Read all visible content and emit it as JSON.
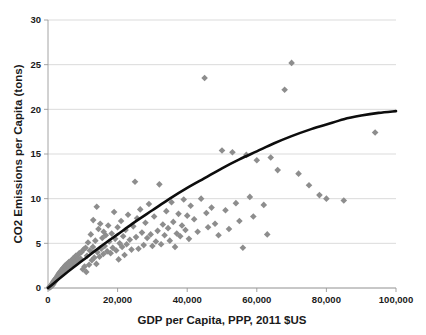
{
  "chart_data": {
    "type": "scatter",
    "title": "",
    "subtitle": "",
    "xlabel": "GDP per Capita, PPP, 2011 $US",
    "ylabel": "CO2 Emissions per Capita (tons)",
    "xlim": [
      0,
      100000
    ],
    "ylim": [
      0,
      30
    ],
    "xticks": [
      0,
      20000,
      40000,
      60000,
      80000,
      100000
    ],
    "xtick_labels": [
      "0",
      "20,000",
      "40,000",
      "60,000",
      "80,000",
      "100,000"
    ],
    "yticks": [
      0,
      5,
      10,
      15,
      20,
      25,
      30
    ],
    "ytick_labels": [
      "0",
      "5",
      "10",
      "15",
      "20",
      "25",
      "30"
    ],
    "grid": "horizontal",
    "legend": "none",
    "marker": {
      "shape": "diamond",
      "color": "#8d8d8d",
      "size": 3.3
    },
    "series": [
      {
        "name": "Countries",
        "type": "scatter",
        "points": [
          [
            300,
            0.05
          ],
          [
            450,
            0.08
          ],
          [
            500,
            0.12
          ],
          [
            620,
            0.1
          ],
          [
            700,
            0.2
          ],
          [
            780,
            0.15
          ],
          [
            850,
            0.25
          ],
          [
            900,
            0.3
          ],
          [
            980,
            0.2
          ],
          [
            1050,
            0.35
          ],
          [
            1100,
            0.4
          ],
          [
            1180,
            0.3
          ],
          [
            1250,
            0.5
          ],
          [
            1300,
            0.45
          ],
          [
            1400,
            0.6
          ],
          [
            1480,
            0.4
          ],
          [
            1550,
            0.7
          ],
          [
            1620,
            0.55
          ],
          [
            1700,
            0.8
          ],
          [
            1800,
            0.65
          ],
          [
            1900,
            0.9
          ],
          [
            2000,
            0.75
          ],
          [
            2100,
            1.0
          ],
          [
            2200,
            0.85
          ],
          [
            2300,
            1.1
          ],
          [
            2400,
            0.95
          ],
          [
            2500,
            1.2
          ],
          [
            2600,
            1.05
          ],
          [
            2700,
            1.35
          ],
          [
            2800,
            1.15
          ],
          [
            2900,
            1.45
          ],
          [
            3000,
            1.25
          ],
          [
            3100,
            1.6
          ],
          [
            3200,
            1.3
          ],
          [
            3300,
            1.7
          ],
          [
            3400,
            1.4
          ],
          [
            3500,
            1.8
          ],
          [
            3600,
            1.5
          ],
          [
            3700,
            1.9
          ],
          [
            3800,
            1.6
          ],
          [
            3900,
            2.0
          ],
          [
            4000,
            1.7
          ],
          [
            4100,
            2.1
          ],
          [
            4200,
            1.8
          ],
          [
            4300,
            2.2
          ],
          [
            4400,
            1.95
          ],
          [
            4500,
            2.3
          ],
          [
            4700,
            2.05
          ],
          [
            4900,
            2.5
          ],
          [
            5000,
            2.15
          ],
          [
            5200,
            2.6
          ],
          [
            5400,
            2.25
          ],
          [
            5600,
            2.7
          ],
          [
            5800,
            2.4
          ],
          [
            6000,
            2.9
          ],
          [
            6200,
            2.5
          ],
          [
            6400,
            3.0
          ],
          [
            6600,
            2.6
          ],
          [
            6800,
            3.1
          ],
          [
            7000,
            2.7
          ],
          [
            7200,
            3.3
          ],
          [
            7400,
            2.8
          ],
          [
            7600,
            3.4
          ],
          [
            7800,
            2.9
          ],
          [
            8000,
            3.6
          ],
          [
            8200,
            3.0
          ],
          [
            8500,
            3.7
          ],
          [
            8800,
            3.2
          ],
          [
            9000,
            3.9
          ],
          [
            9300,
            3.3
          ],
          [
            9600,
            4.0
          ],
          [
            10000,
            2.1
          ],
          [
            10200,
            4.3
          ],
          [
            10500,
            2.4
          ],
          [
            10800,
            4.5
          ],
          [
            11000,
            1.8
          ],
          [
            11200,
            3.6
          ],
          [
            11500,
            5.1
          ],
          [
            11800,
            2.6
          ],
          [
            12000,
            4.2
          ],
          [
            12300,
            6.0
          ],
          [
            12600,
            3.1
          ],
          [
            12900,
            4.6
          ],
          [
            13000,
            7.6
          ],
          [
            13300,
            3.4
          ],
          [
            13600,
            5.3
          ],
          [
            13900,
            2.7
          ],
          [
            14000,
            9.1
          ],
          [
            14200,
            4.0
          ],
          [
            14500,
            6.6
          ],
          [
            14800,
            3.5
          ],
          [
            15000,
            7.2
          ],
          [
            15300,
            4.4
          ],
          [
            15600,
            5.6
          ],
          [
            15900,
            3.8
          ],
          [
            16000,
            6.3
          ],
          [
            16300,
            4.7
          ],
          [
            16600,
            5.9
          ],
          [
            17000,
            4.1
          ],
          [
            17300,
            7.0
          ],
          [
            17600,
            5.2
          ],
          [
            18000,
            3.9
          ],
          [
            18300,
            6.1
          ],
          [
            18600,
            4.5
          ],
          [
            19000,
            8.5
          ],
          [
            19300,
            5.5
          ],
          [
            19600,
            4.2
          ],
          [
            20000,
            6.8
          ],
          [
            20300,
            3.2
          ],
          [
            20600,
            5.0
          ],
          [
            21000,
            7.5
          ],
          [
            21300,
            4.6
          ],
          [
            21600,
            5.8
          ],
          [
            22000,
            3.7
          ],
          [
            22300,
            6.5
          ],
          [
            22600,
            4.9
          ],
          [
            23000,
            8.2
          ],
          [
            23500,
            5.4
          ],
          [
            24000,
            4.3
          ],
          [
            24500,
            6.9
          ],
          [
            25000,
            11.9
          ],
          [
            25300,
            5.7
          ],
          [
            25600,
            7.8
          ],
          [
            26000,
            4.4
          ],
          [
            26500,
            8.8
          ],
          [
            27000,
            6.2
          ],
          [
            27500,
            4.8
          ],
          [
            28000,
            7.3
          ],
          [
            28500,
            5.6
          ],
          [
            29000,
            9.4
          ],
          [
            29500,
            6.0
          ],
          [
            30000,
            4.7
          ],
          [
            30500,
            8.0
          ],
          [
            31000,
            5.2
          ],
          [
            31500,
            6.4
          ],
          [
            32000,
            11.6
          ],
          [
            32500,
            4.9
          ],
          [
            33000,
            7.1
          ],
          [
            33500,
            5.9
          ],
          [
            34000,
            8.6
          ],
          [
            34500,
            6.7
          ],
          [
            35000,
            5.3
          ],
          [
            35500,
            9.6
          ],
          [
            36000,
            7.4
          ],
          [
            36500,
            4.6
          ],
          [
            37000,
            6.1
          ],
          [
            37500,
            8.3
          ],
          [
            38000,
            5.8
          ],
          [
            38500,
            7.0
          ],
          [
            39000,
            9.9
          ],
          [
            39500,
            6.5
          ],
          [
            40000,
            8.1
          ],
          [
            40500,
            5.5
          ],
          [
            41000,
            9.2
          ],
          [
            42000,
            7.7
          ],
          [
            43000,
            6.3
          ],
          [
            44000,
            10.0
          ],
          [
            45000,
            23.5
          ],
          [
            45500,
            8.4
          ],
          [
            46000,
            6.8
          ],
          [
            47000,
            9.0
          ],
          [
            48000,
            7.2
          ],
          [
            49000,
            5.9
          ],
          [
            50000,
            15.4
          ],
          [
            51000,
            8.7
          ],
          [
            52000,
            6.6
          ],
          [
            53000,
            15.2
          ],
          [
            54000,
            9.5
          ],
          [
            55000,
            7.5
          ],
          [
            56000,
            4.5
          ],
          [
            57000,
            14.9
          ],
          [
            58000,
            10.2
          ],
          [
            59000,
            8.0
          ],
          [
            60000,
            14.3
          ],
          [
            62000,
            9.3
          ],
          [
            63000,
            6.0
          ],
          [
            64000,
            14.6
          ],
          [
            66000,
            13.2
          ],
          [
            68000,
            22.2
          ],
          [
            70000,
            25.2
          ],
          [
            72000,
            12.8
          ],
          [
            75000,
            11.5
          ],
          [
            78000,
            10.4
          ],
          [
            80000,
            10.0
          ],
          [
            85000,
            9.8
          ],
          [
            94000,
            17.4
          ]
        ]
      },
      {
        "name": "Fitted trend",
        "type": "line",
        "description": "concave increasing fit from origin to about 19.8 tons at 100,000",
        "points": [
          [
            0,
            0.0
          ],
          [
            5000,
            1.6
          ],
          [
            10000,
            3.1
          ],
          [
            15000,
            4.6
          ],
          [
            20000,
            6.0
          ],
          [
            25000,
            7.4
          ],
          [
            30000,
            8.7
          ],
          [
            35000,
            10.0
          ],
          [
            40000,
            11.2
          ],
          [
            45000,
            12.3
          ],
          [
            50000,
            13.4
          ],
          [
            55000,
            14.4
          ],
          [
            60000,
            15.3
          ],
          [
            65000,
            16.2
          ],
          [
            70000,
            17.0
          ],
          [
            75000,
            17.7
          ],
          [
            80000,
            18.3
          ],
          [
            85000,
            18.9
          ],
          [
            90000,
            19.3
          ],
          [
            95000,
            19.6
          ],
          [
            100000,
            19.8
          ]
        ]
      }
    ]
  },
  "figure": {
    "background_color": "#ffffff",
    "grid_color": "#d2d2d2",
    "axis_color": "#9a9a9a",
    "trend_color": "#0d0d0d",
    "marker_color": "#8d8d8d"
  }
}
